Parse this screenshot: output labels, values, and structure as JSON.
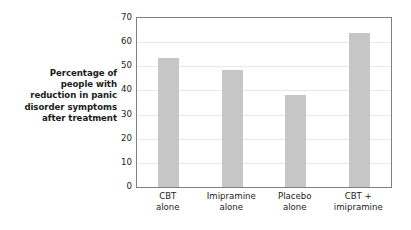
{
  "chart_data": {
    "type": "bar",
    "title": "",
    "subtitle": "",
    "categories": [
      "CBT alone",
      "Imipramine alone",
      "Placebo alone",
      "CBT + imipramine"
    ],
    "category_lines": [
      [
        "CBT",
        "alone"
      ],
      [
        "Imipramine",
        "alone"
      ],
      [
        "Placebo",
        "alone"
      ],
      [
        "CBT +",
        "imipramine"
      ]
    ],
    "values": [
      53.5,
      48.5,
      38,
      64
    ],
    "xlabel": "",
    "ylabel": "Percentage of people with reduction in panic disorder symptoms after treatment",
    "ylabel_lines": [
      "Percentage of",
      "people with",
      "reduction in panic",
      "disorder symptoms",
      "after treatment"
    ],
    "ylim": [
      0,
      70
    ],
    "ytick_values": [
      0,
      10,
      20,
      30,
      40,
      50,
      60,
      70
    ],
    "ytick_labels": [
      "0",
      "10",
      "20",
      "30",
      "40",
      "50",
      "60",
      "70"
    ],
    "xlim_categories": 4,
    "grid": true,
    "grid_axis": "y",
    "legend": null,
    "legend_position": "none",
    "annotations": []
  },
  "style": {
    "bar_color": "#c6c6c6",
    "gridline_color": "#e8e8e8",
    "frame_color": "#808080",
    "text_color": "#1b1b1b",
    "background_color": "#ffffff"
  }
}
